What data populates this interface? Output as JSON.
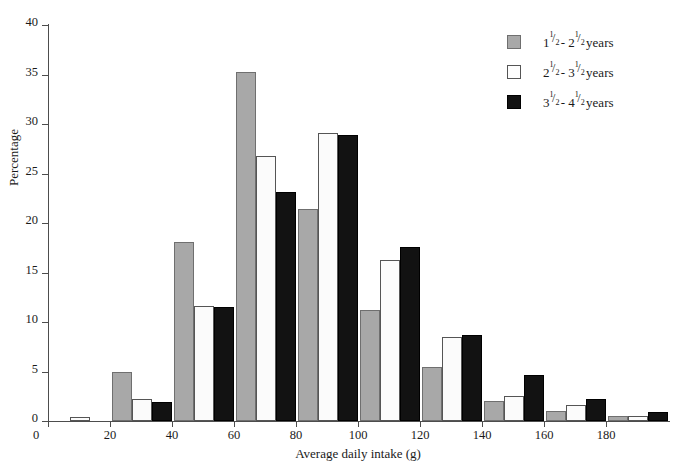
{
  "chart_data": {
    "type": "bar",
    "title": "",
    "xlabel": "Average daily intake (g)",
    "ylabel": "Percentage",
    "xlim": [
      0,
      200
    ],
    "ylim": [
      0,
      40
    ],
    "xticks": [
      0,
      20,
      40,
      60,
      80,
      100,
      120,
      140,
      160,
      180
    ],
    "yticks": [
      0,
      5,
      10,
      15,
      20,
      25,
      30,
      35,
      40
    ],
    "grid": false,
    "legend_position": "top-right",
    "bin_width": 20,
    "categories": [
      "0-20",
      "20-40",
      "40-60",
      "60-80",
      "80-100",
      "100-120",
      "120-140",
      "140-160",
      "160-180",
      "180-200"
    ],
    "bin_starts": [
      0,
      20,
      40,
      60,
      80,
      100,
      120,
      140,
      160,
      180
    ],
    "series": [
      {
        "name": "1 1/2 - 2 1/2 years",
        "color": "#a8a8a8",
        "values": [
          0.0,
          5.0,
          18.1,
          35.3,
          21.4,
          11.2,
          5.5,
          2.0,
          1.0,
          0.5
        ]
      },
      {
        "name": "2 1/2 - 3 1/2 years",
        "color": "#fbfbfb",
        "values": [
          0.4,
          2.2,
          11.6,
          26.8,
          29.1,
          16.3,
          8.5,
          2.5,
          1.6,
          0.5
        ]
      },
      {
        "name": "3 1/2 - 4 1/2 years",
        "color": "#121212",
        "values": [
          0.0,
          1.9,
          11.5,
          23.1,
          28.9,
          17.6,
          8.7,
          4.6,
          2.2,
          0.9
        ]
      }
    ]
  },
  "legend": {
    "entries": [
      {
        "whole_a": "1",
        "num_a": "1",
        "den_a": "2",
        "dash": " - ",
        "whole_b": "2",
        "num_b": "1",
        "den_b": "2",
        "unit": " years",
        "swatch": "gray-swatch",
        "plain": "1 1/2 - 2 1/2 years"
      },
      {
        "whole_a": "2",
        "num_a": "1",
        "den_a": "2",
        "dash": " - ",
        "whole_b": "3",
        "num_b": "1",
        "den_b": "2",
        "unit": " years",
        "swatch": "white-swatch",
        "plain": "2 1/2 - 3 1/2 years"
      },
      {
        "whole_a": "3",
        "num_a": "1",
        "den_a": "2",
        "dash": " - ",
        "whole_b": "4",
        "num_b": "1",
        "den_b": "2",
        "unit": " years",
        "swatch": "black-swatch",
        "plain": "3 1/2 - 4 1/2 years"
      }
    ]
  },
  "colors": {
    "series_1": "#a8a8a8",
    "series_2": "#fbfbfb",
    "series_3": "#121212",
    "axis": "#4d4d4d",
    "text": "#1a1a1a",
    "background": "#ffffff"
  }
}
